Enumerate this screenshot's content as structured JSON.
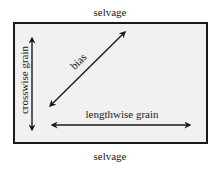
{
  "diagram": {
    "type": "fabric-grain-diagram",
    "labels": {
      "top_edge": "selvage",
      "bottom_edge": "selvage",
      "vertical_arrow": "crosswise grain",
      "diagonal_arrow": "bias",
      "horizontal_arrow": "lengthwise grain"
    },
    "colors": {
      "fabric_fill": "#f1f1f1",
      "border": "#1a1a1a",
      "arrow": "#1a1a1a",
      "text": "#1a1a1a",
      "background": "#ffffff"
    },
    "arrows": [
      {
        "id": "crosswise",
        "direction": "vertical",
        "heads": "both"
      },
      {
        "id": "bias",
        "direction": "diagonal",
        "heads": "both"
      },
      {
        "id": "lengthwise",
        "direction": "horizontal",
        "heads": "both"
      }
    ]
  }
}
